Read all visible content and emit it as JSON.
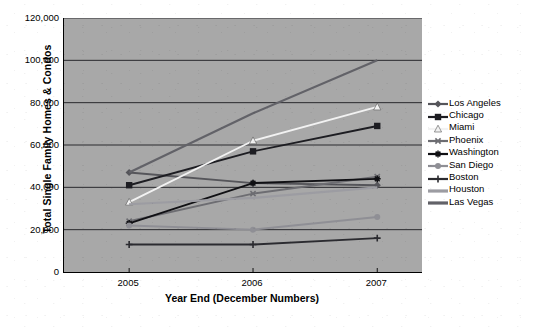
{
  "chart_data": {
    "type": "line",
    "title": "",
    "xlabel": "Year End (December Numbers)",
    "ylabel": "Total Single Family Homes & Condos",
    "categories": [
      "2005",
      "2006",
      "2007"
    ],
    "x_tick_labels": [
      "2005",
      "2006",
      "2007"
    ],
    "y_tick_labels": [
      "0",
      "20,000",
      "40,000",
      "60,000",
      "80,000",
      "100,000",
      "120,000"
    ],
    "y_ticks": [
      0,
      20000,
      40000,
      60000,
      80000,
      100000,
      120000
    ],
    "ylim": [
      0,
      120000
    ],
    "grid": "horizontal",
    "legend_position": "right",
    "plot_background": "#a8a8a8",
    "series": [
      {
        "name": "Los Angeles",
        "values": [
          47000,
          42000,
          41000
        ],
        "color": "#55555a",
        "marker": "diamond"
      },
      {
        "name": "Chicago",
        "values": [
          41000,
          57000,
          69000
        ],
        "color": "#1d1d22",
        "marker": "square"
      },
      {
        "name": "Miami",
        "values": [
          33000,
          62000,
          78000
        ],
        "color": "#f2f2f2",
        "marker": "triangle"
      },
      {
        "name": "Phoenix",
        "values": [
          24000,
          37000,
          45000
        ],
        "color": "#6d6d72",
        "marker": "cross"
      },
      {
        "name": "Washington",
        "values": [
          23000,
          42000,
          44000
        ],
        "color": "#101014",
        "marker": "star"
      },
      {
        "name": "San Diego",
        "values": [
          22000,
          20000,
          26000
        ],
        "color": "#8f8f95",
        "marker": "circle"
      },
      {
        "name": "Boston",
        "values": [
          13000,
          13000,
          16000
        ],
        "color": "#2b2b30",
        "marker": "plus"
      },
      {
        "name": "Houston",
        "values": [
          32000,
          35000,
          40000
        ],
        "color": "#9c9ca2",
        "marker": "none"
      },
      {
        "name": "Las Vegas",
        "values": [
          47000,
          75000,
          100000
        ],
        "color": "#626268",
        "marker": "none"
      }
    ]
  },
  "legend": {
    "items": [
      {
        "label": "Los Angeles"
      },
      {
        "label": "Chicago"
      },
      {
        "label": "Miami"
      },
      {
        "label": "Phoenix"
      },
      {
        "label": "Washington"
      },
      {
        "label": "San Diego"
      },
      {
        "label": "Boston"
      },
      {
        "label": "Houston"
      },
      {
        "label": "Las Vegas"
      }
    ]
  }
}
